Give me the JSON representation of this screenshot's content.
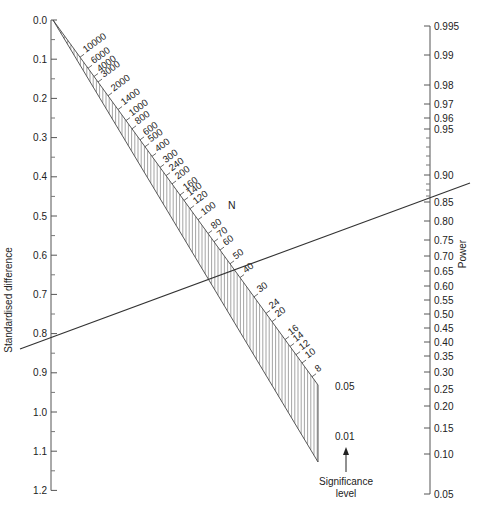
{
  "chart_data": {
    "type": "nomogram",
    "title": "",
    "left_axis": {
      "label": "Standardised difference",
      "ticks": [
        "0.0",
        "0.1",
        "0.2",
        "0.3",
        "0.4",
        "0.5",
        "0.6",
        "0.7",
        "0.8",
        "0.9",
        "1.0",
        "1.1",
        "1.2"
      ],
      "range": [
        0.0,
        1.2
      ]
    },
    "right_axis": {
      "label": "Power",
      "ticks": [
        "0.995",
        "0.99",
        "0.98",
        "0.97",
        "0.96",
        "0.95",
        "0.90",
        "0.85",
        "0.80",
        "0.75",
        "0.70",
        "0.65",
        "0.60",
        "0.55",
        "0.50",
        "0.45",
        "0.40",
        "0.35",
        "0.30",
        "0.25",
        "0.20",
        "0.15",
        "0.10",
        "0.05"
      ]
    },
    "n_scale": {
      "label": "N",
      "ticks": [
        "10000",
        "6000",
        "4000",
        "3000",
        "2000",
        "1400",
        "1000",
        "800",
        "600",
        "500",
        "400",
        "300",
        "240",
        "200",
        "160",
        "140",
        "120",
        "100",
        "80",
        "70",
        "60",
        "50",
        "40",
        "30",
        "24",
        "20",
        "16",
        "14",
        "12",
        "10",
        "8"
      ]
    },
    "significance": {
      "label_line1": "Significance",
      "label_line2": "level",
      "levels": [
        "0.05",
        "0.01"
      ]
    },
    "example_line": {
      "standardised_difference": 0.8,
      "power": 0.9,
      "n_at_0_05": 60
    }
  },
  "labels": {
    "left_axis_title": "Standardised difference",
    "right_axis_title": "Power",
    "n_title": "N",
    "sig_005": "0.05",
    "sig_001": "0.01",
    "sig_title1": "Significance",
    "sig_title2": "level"
  }
}
